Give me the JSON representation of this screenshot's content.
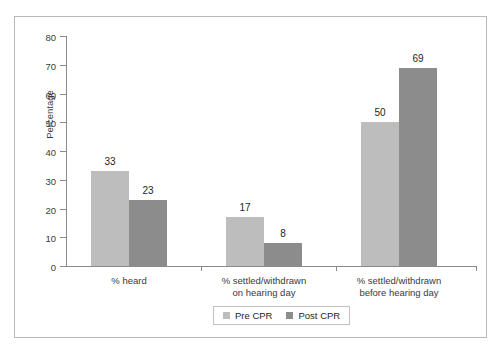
{
  "chart_data": {
    "type": "bar",
    "title": "",
    "subtitle": "",
    "xlabel": "",
    "ylabel": "Percentage",
    "ylim": [
      0,
      80
    ],
    "ytick_step": 10,
    "yticks": [
      "80",
      "70",
      "60",
      "50",
      "40",
      "30",
      "20",
      "10",
      "0"
    ],
    "grid": false,
    "legend_position": "bottom-center",
    "categories": [
      "% heard",
      "% settled/withdrawn\non hearing day",
      "% settled/withdrawn\nbefore hearing day"
    ],
    "category_lines": [
      [
        "% heard"
      ],
      [
        "% settled/withdrawn",
        "on hearing day"
      ],
      [
        "% settled/withdrawn",
        "before hearing day"
      ]
    ],
    "series": [
      {
        "name": "Pre CPR",
        "color": "#bdbdbd",
        "values": [
          33,
          17,
          50
        ],
        "labels": [
          "33",
          "17",
          "50"
        ]
      },
      {
        "name": "Post CPR",
        "color": "#8c8c8c",
        "values": [
          23,
          8,
          69
        ],
        "labels": [
          "23",
          "8",
          "69"
        ]
      }
    ]
  },
  "legend": {
    "entries": [
      {
        "label": "Pre CPR",
        "color": "#bdbdbd"
      },
      {
        "label": "Post CPR",
        "color": "#8c8c8c"
      }
    ]
  },
  "colors": {
    "pre_cpr": "#bdbdbd",
    "post_cpr": "#8c8c8c",
    "axis": "#8a8a8a",
    "frame": "#b9b9b9",
    "text": "#231f20",
    "background": "#ffffff"
  }
}
